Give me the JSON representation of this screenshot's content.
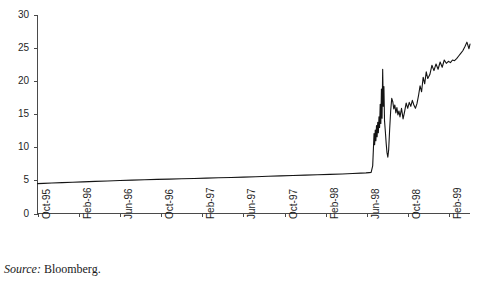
{
  "figure": {
    "title": "",
    "title_clipped": true,
    "source_label": "Source:",
    "source_value": "Bloomberg.",
    "background_color": "#ffffff",
    "line_color": "#141414",
    "axis_color": "#4a4a4a"
  },
  "chart_data": {
    "type": "line",
    "title": "",
    "xlabel": "",
    "ylabel": "",
    "ylim": [
      0,
      30
    ],
    "yticks": [
      0,
      5,
      10,
      15,
      20,
      25,
      30
    ],
    "ytick_labels": [
      "0",
      "5",
      "10",
      "15",
      "20",
      "25",
      "30"
    ],
    "grid": false,
    "legend": "none",
    "xtick_labels": [
      "Oct-95",
      "Feb-96",
      "Jun-96",
      "Oct-96",
      "Feb-97",
      "Jun-97",
      "Oct-97",
      "Feb-98",
      "Jun-98",
      "Oct-98",
      "Feb-99"
    ],
    "xtick_positions_months": [
      0,
      4,
      8,
      12,
      16,
      20,
      24,
      28,
      32,
      36,
      40
    ],
    "x_start": "Oct-95",
    "x_end": "Apr-99",
    "series": [
      {
        "name": "Exchange rate",
        "color": "#141414",
        "x": [
          0.0,
          0.6,
          1.4,
          2.4,
          3.4,
          4.4,
          5.6,
          6.8,
          8.0,
          9.2,
          10.4,
          11.6,
          12.8,
          14.0,
          15.2,
          16.4,
          17.6,
          18.8,
          20.0,
          21.2,
          22.4,
          23.6,
          24.8,
          26.0,
          27.2,
          28.4,
          29.6,
          30.6,
          31.4,
          31.9,
          32.2,
          32.4,
          32.55,
          32.62,
          32.68,
          32.74,
          32.8,
          32.86,
          32.92,
          32.98,
          33.04,
          33.1,
          33.16,
          33.22,
          33.28,
          33.34,
          33.4,
          33.46,
          33.52,
          33.58,
          33.64,
          33.7,
          33.78,
          33.86,
          33.94,
          34.02,
          34.1,
          34.2,
          34.3,
          34.4,
          34.5,
          34.6,
          34.7,
          34.8,
          34.9,
          35.0,
          35.1,
          35.2,
          35.35,
          35.5,
          35.65,
          35.8,
          35.95,
          36.1,
          36.25,
          36.4,
          36.55,
          36.7,
          36.85,
          37.0,
          37.15,
          37.3,
          37.45,
          37.6,
          37.75,
          37.9,
          38.1,
          38.3,
          38.5,
          38.7,
          38.9,
          39.1,
          39.3,
          39.5,
          39.7,
          39.9,
          40.1,
          40.3,
          40.5,
          40.7,
          40.9,
          41.1,
          41.3,
          41.5,
          41.7,
          41.9,
          42.0
        ],
        "y": [
          4.52,
          4.55,
          4.6,
          4.66,
          4.72,
          4.78,
          4.85,
          4.92,
          4.98,
          5.04,
          5.1,
          5.15,
          5.2,
          5.25,
          5.3,
          5.35,
          5.4,
          5.45,
          5.5,
          5.56,
          5.62,
          5.68,
          5.74,
          5.8,
          5.86,
          5.92,
          5.98,
          6.04,
          6.1,
          6.14,
          6.18,
          6.2,
          7.2,
          9.8,
          12.1,
          10.4,
          12.6,
          11.0,
          13.3,
          11.6,
          13.8,
          12.2,
          14.6,
          13.0,
          16.5,
          13.6,
          18.8,
          14.4,
          21.8,
          16.2,
          19.2,
          14.0,
          12.4,
          10.6,
          9.2,
          8.5,
          9.6,
          12.8,
          15.6,
          17.4,
          16.9,
          15.8,
          16.4,
          15.2,
          16.0,
          14.9,
          15.5,
          14.6,
          15.9,
          14.3,
          15.4,
          16.7,
          15.9,
          16.8,
          16.2,
          17.1,
          16.4,
          15.9,
          16.6,
          17.8,
          19.3,
          18.4,
          20.6,
          19.6,
          21.4,
          20.4,
          21.0,
          22.4,
          21.6,
          22.6,
          21.8,
          22.9,
          22.1,
          23.2,
          22.7,
          23.0,
          22.8,
          23.2,
          23.1,
          23.4,
          23.8,
          24.2,
          24.6,
          25.2,
          25.9,
          24.9,
          25.6
        ]
      }
    ]
  }
}
